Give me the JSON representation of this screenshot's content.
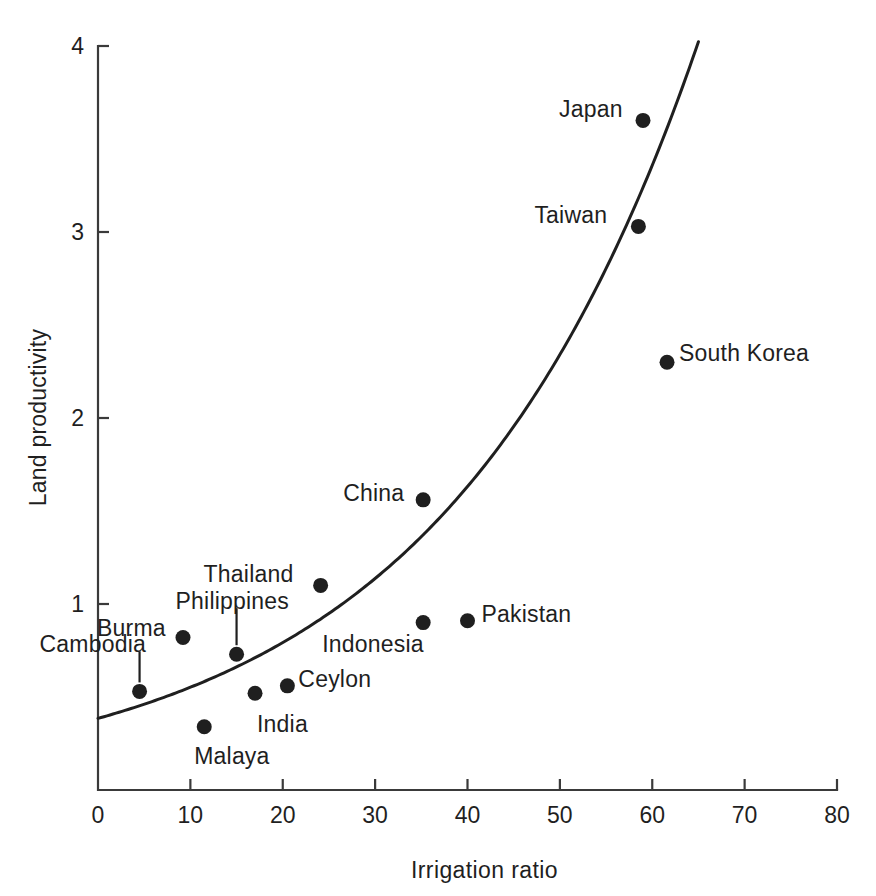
{
  "chart_data": {
    "type": "scatter",
    "title": "",
    "xlabel": "Irrigation  ratio",
    "ylabel": "Land productivity",
    "xlim": [
      0,
      80
    ],
    "ylim": [
      0,
      4
    ],
    "xticks": [
      "0",
      "10",
      "20",
      "30",
      "40",
      "50",
      "60",
      "70",
      "80"
    ],
    "yticks": [
      "1",
      "2",
      "3",
      "4"
    ],
    "grid": false,
    "legend": "none",
    "marker_color": "#1f1f1f",
    "line_color": "#1f1f1f",
    "axis_color": "#3a3a3a",
    "points": [
      {
        "label": "Cambodia",
        "x": 4.5,
        "y": 0.53,
        "label_dx": -100,
        "label_dy": -44,
        "leader": true
      },
      {
        "label": "Burma",
        "x": 9.2,
        "y": 0.82,
        "label_dx": -86,
        "label_dy": -6,
        "leader": false
      },
      {
        "label": "Malaya",
        "x": 11.5,
        "y": 0.34,
        "label_dx": -10,
        "label_dy": 32,
        "leader": false
      },
      {
        "label": "Philippines",
        "x": 15.0,
        "y": 0.73,
        "label_dx": -61,
        "label_dy": -50,
        "leader": true
      },
      {
        "label": "India",
        "x": 17.0,
        "y": 0.52,
        "label_dx": 2,
        "label_dy": 34,
        "leader": false
      },
      {
        "label": "Ceylon",
        "x": 20.5,
        "y": 0.56,
        "label_dx": 11,
        "label_dy": -4,
        "leader": false
      },
      {
        "label": "Thailand",
        "x": 24.1,
        "y": 1.1,
        "label_dx": -117,
        "label_dy": -8,
        "leader": false
      },
      {
        "label": "China",
        "x": 35.2,
        "y": 1.56,
        "label_dx": -80,
        "label_dy": -4,
        "leader": false
      },
      {
        "label": "Indonesia",
        "x": 35.2,
        "y": 0.9,
        "label_dx": -101,
        "label_dy": 24,
        "leader": false
      },
      {
        "label": "Pakistan",
        "x": 40.0,
        "y": 0.91,
        "label_dx": 14,
        "label_dy": -4,
        "leader": false
      },
      {
        "label": "Taiwan",
        "x": 58.5,
        "y": 3.03,
        "label_dx": -104,
        "label_dy": -8,
        "leader": false
      },
      {
        "label": "Japan",
        "x": 59.0,
        "y": 3.6,
        "label_dx": -84,
        "label_dy": -8,
        "leader": false
      },
      {
        "label": "South Korea",
        "x": 61.6,
        "y": 2.3,
        "label_dx": 12,
        "label_dy": -6,
        "leader": false
      }
    ],
    "fit_curve": {
      "description": "exponential trend line",
      "form": "y = a * exp(b * x)",
      "a": 0.385,
      "b": 0.0361,
      "x_start": 0,
      "x_end": 65.0
    }
  }
}
